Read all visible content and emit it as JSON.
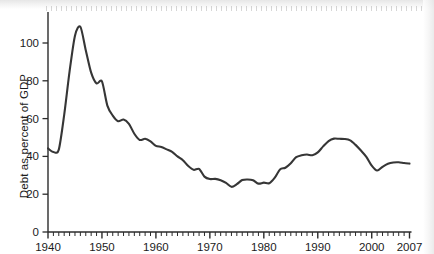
{
  "chart_data": {
    "type": "line",
    "title": "",
    "xlabel": "",
    "ylabel": "Debt as percent of GDP",
    "xlim": [
      1940,
      2007
    ],
    "ylim": [
      0,
      115
    ],
    "grid": false,
    "legend": null,
    "y_ticks": [
      0,
      20,
      40,
      60,
      80,
      100
    ],
    "y_tick_labels": [
      "0",
      "20",
      "40",
      "60",
      "80",
      "100"
    ],
    "x_ticks": [
      1940,
      1950,
      1960,
      1970,
      1980,
      1990,
      2000,
      2007
    ],
    "x_tick_labels": [
      "1940",
      "1950",
      "1960",
      "1970",
      "1980",
      "1990",
      "2000",
      "2007"
    ],
    "x_minor_tick_interval": 1,
    "line_color": "#363636",
    "line_width": 2.1,
    "x": [
      1940,
      1941,
      1942,
      1943,
      1944,
      1945,
      1946,
      1947,
      1948,
      1949,
      1950,
      1951,
      1952,
      1953,
      1954,
      1955,
      1956,
      1957,
      1958,
      1959,
      1960,
      1961,
      1962,
      1963,
      1964,
      1965,
      1966,
      1967,
      1968,
      1969,
      1970,
      1971,
      1972,
      1973,
      1974,
      1975,
      1976,
      1977,
      1978,
      1979,
      1980,
      1981,
      1982,
      1983,
      1984,
      1985,
      1986,
      1987,
      1988,
      1989,
      1990,
      1991,
      1992,
      1993,
      1994,
      1995,
      1996,
      1997,
      1998,
      1999,
      2000,
      2001,
      2002,
      2003,
      2004,
      2005,
      2006,
      2007
    ],
    "values": [
      44.2,
      42.3,
      43.6,
      62.0,
      85.0,
      103.9,
      108.6,
      96.2,
      84.3,
      78.6,
      79.7,
      66.9,
      61.6,
      58.6,
      59.5,
      57.2,
      52.0,
      48.7,
      49.3,
      47.9,
      45.6,
      45.0,
      43.7,
      42.4,
      40.0,
      38.0,
      34.9,
      32.9,
      33.4,
      29.3,
      28.0,
      28.1,
      27.4,
      26.0,
      23.9,
      25.3,
      27.5,
      27.8,
      27.4,
      25.6,
      26.1,
      25.8,
      28.6,
      33.1,
      34.0,
      36.4,
      39.6,
      40.6,
      41.0,
      40.6,
      42.1,
      45.3,
      48.1,
      49.4,
      49.3,
      49.2,
      48.5,
      46.1,
      43.1,
      39.8,
      35.1,
      32.5,
      34.5,
      36.1,
      36.8,
      36.9,
      36.5,
      36.2
    ]
  },
  "axes": {
    "x_axis_name": "year-axis",
    "y_axis_name": "debt-percent-axis"
  }
}
